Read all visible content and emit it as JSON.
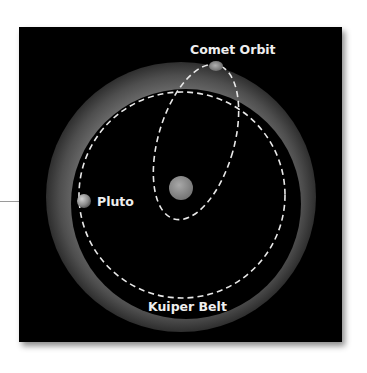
{
  "diagram": {
    "labels": {
      "comet_orbit": "Comet Orbit",
      "pluto": "Pluto",
      "kuiper_belt": "Kuiper Belt"
    },
    "colors": {
      "background": "#000000",
      "belt_outer": "#3a3a3a",
      "belt_inner": "#5a5a5a",
      "orbit_dash": "#e8e8e8",
      "sun": "#8a8a8a",
      "text": "#eeeeee"
    },
    "objects": {
      "sun": "Sun",
      "pluto": "Pluto",
      "comet": "Comet"
    }
  }
}
